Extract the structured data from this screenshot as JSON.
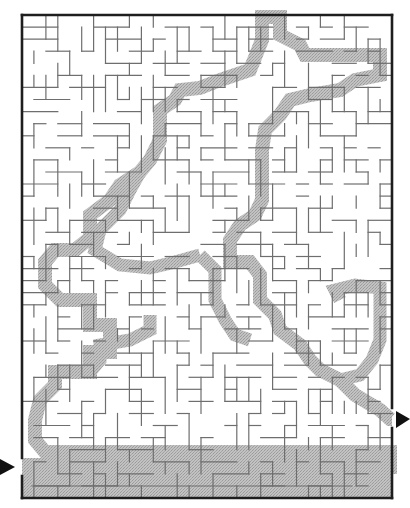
{
  "puzzle": {
    "type": "maze",
    "title": "",
    "entrance": {
      "side": "left",
      "arrow": "right-pointing-triangle"
    },
    "exit": {
      "side": "right",
      "arrow": "right-pointing-triangle"
    },
    "solution_shown": true
  },
  "colors": {
    "background": "#ffffff",
    "border": "#1e1e1e",
    "walls": "#6e6e6e",
    "solution_fill": "#b8b8b8",
    "arrows": "#111111"
  },
  "geometry": {
    "left": 22,
    "top": 15,
    "right": 392,
    "bottom": 498,
    "cols": 31,
    "rows": 40,
    "entrance_gap": [
      458,
      476
    ],
    "exit_gap": [
      408,
      428
    ]
  },
  "solution_path": [
    [
      22,
      467
    ],
    [
      200,
      467
    ],
    [
      390,
      467
    ],
    [
      390,
      452
    ],
    [
      200,
      452
    ],
    [
      60,
      452
    ],
    [
      45,
      452
    ],
    [
      35,
      440
    ],
    [
      35,
      420
    ],
    [
      40,
      400
    ],
    [
      55,
      385
    ],
    [
      55,
      372
    ],
    [
      90,
      372
    ],
    [
      90,
      352
    ],
    [
      110,
      352
    ],
    [
      110,
      325
    ],
    [
      90,
      325
    ],
    [
      90,
      300
    ],
    [
      60,
      300
    ],
    [
      45,
      285
    ],
    [
      45,
      262
    ],
    [
      55,
      250
    ],
    [
      75,
      250
    ],
    [
      90,
      238
    ],
    [
      90,
      215
    ],
    [
      110,
      200
    ],
    [
      120,
      185
    ],
    [
      140,
      172
    ],
    [
      150,
      160
    ],
    [
      160,
      140
    ],
    [
      160,
      110
    ],
    [
      175,
      100
    ],
    [
      180,
      90
    ],
    [
      200,
      88
    ],
    [
      220,
      80
    ],
    [
      250,
      70
    ],
    [
      262,
      40
    ],
    [
      262,
      17
    ],
    [
      280,
      17
    ],
    [
      280,
      35
    ],
    [
      300,
      45
    ],
    [
      305,
      55
    ],
    [
      380,
      55
    ],
    [
      380,
      75
    ],
    [
      355,
      80
    ],
    [
      340,
      90
    ],
    [
      310,
      95
    ],
    [
      290,
      100
    ],
    [
      280,
      115
    ],
    [
      265,
      130
    ],
    [
      262,
      150
    ],
    [
      262,
      200
    ],
    [
      255,
      215
    ],
    [
      240,
      225
    ],
    [
      230,
      240
    ],
    [
      230,
      262
    ],
    [
      250,
      262
    ],
    [
      260,
      275
    ],
    [
      260,
      300
    ],
    [
      275,
      315
    ],
    [
      280,
      330
    ],
    [
      300,
      345
    ],
    [
      310,
      360
    ],
    [
      320,
      370
    ],
    [
      340,
      380
    ],
    [
      355,
      395
    ],
    [
      380,
      410
    ],
    [
      390,
      419
    ],
    [
      392,
      419
    ]
  ],
  "secondary_branches": [
    [
      [
        140,
        172
      ],
      [
        130,
        190
      ],
      [
        120,
        210
      ],
      [
        100,
        230
      ],
      [
        95,
        250
      ],
      [
        120,
        265
      ],
      [
        150,
        268
      ],
      [
        175,
        262
      ],
      [
        200,
        255
      ]
    ],
    [
      [
        200,
        255
      ],
      [
        215,
        270
      ],
      [
        215,
        300
      ],
      [
        225,
        320
      ],
      [
        235,
        335
      ],
      [
        250,
        340
      ]
    ],
    [
      [
        340,
        300
      ],
      [
        335,
        290
      ],
      [
        355,
        285
      ],
      [
        380,
        288
      ],
      [
        380,
        340
      ],
      [
        372,
        360
      ],
      [
        360,
        375
      ],
      [
        340,
        380
      ]
    ],
    [
      [
        90,
        372
      ],
      [
        100,
        360
      ],
      [
        100,
        345
      ],
      [
        130,
        340
      ],
      [
        150,
        330
      ],
      [
        150,
        315
      ]
    ]
  ]
}
